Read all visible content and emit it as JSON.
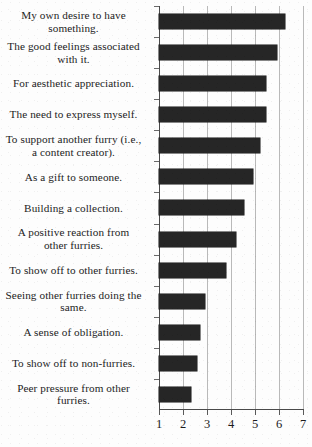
{
  "chart_data": {
    "type": "bar",
    "orientation": "horizontal",
    "title": "",
    "subtitle": "",
    "xlabel": "",
    "ylabel": "",
    "xlim": [
      1,
      7
    ],
    "xticks": [
      1,
      2,
      3,
      4,
      5,
      6,
      7
    ],
    "xtick_labels": [
      "1",
      "2",
      "3",
      "4",
      "5",
      "6",
      "7"
    ],
    "grid": true,
    "grid_axis": "x",
    "legend": false,
    "legend_position": "none",
    "bar_color": "#262626",
    "categories": [
      "My own desire to have something.",
      "The good feelings associated with it.",
      "For aesthetic appreciation.",
      "The need to express myself.",
      "To support another furry (i.e., a content creator).",
      "As a gift to someone.",
      "Building a collection.",
      "A positive reaction from other furries.",
      "To show off to other furries.",
      "Seeing other furries doing the same.",
      "A sense of obligation.",
      "To show off to non-furries.",
      "Peer pressure from other furries."
    ],
    "values": [
      6.25,
      5.9,
      5.45,
      5.45,
      5.2,
      4.9,
      4.55,
      4.2,
      3.8,
      2.9,
      2.7,
      2.6,
      2.35
    ]
  },
  "axis": {
    "tick_labels": [
      "1",
      "2",
      "3",
      "4",
      "5",
      "6",
      "7"
    ]
  },
  "categories": [
    {
      "lines": [
        "My own desire to have",
        "something."
      ]
    },
    {
      "lines": [
        "The good feelings associated",
        "with it."
      ]
    },
    {
      "lines": [
        "For aesthetic appreciation."
      ]
    },
    {
      "lines": [
        "The need to express myself."
      ]
    },
    {
      "lines": [
        "To support another furry (i.e.,",
        "a content creator)."
      ]
    },
    {
      "lines": [
        "As a gift to someone."
      ]
    },
    {
      "lines": [
        "Building a collection."
      ]
    },
    {
      "lines": [
        "A positive reaction from",
        "other furries."
      ]
    },
    {
      "lines": [
        "To show off to other furries."
      ]
    },
    {
      "lines": [
        "Seeing other furries doing the",
        "same."
      ]
    },
    {
      "lines": [
        "A sense of obligation."
      ]
    },
    {
      "lines": [
        "To show off to non-furries."
      ]
    },
    {
      "lines": [
        "Peer pressure from other",
        "furries."
      ]
    }
  ]
}
